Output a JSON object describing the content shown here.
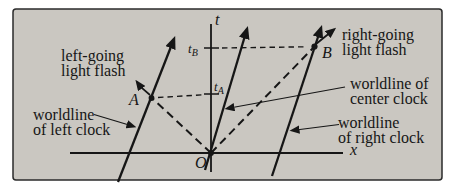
{
  "colors": {
    "page_bg": "#ffffff",
    "panel_bg": "#cac7c1",
    "panel_border": "#2b2b2b",
    "ink": "#161616"
  },
  "axes": {
    "t_label": "t",
    "x_label": "x",
    "origin_label": "O"
  },
  "ticks": {
    "t_A": {
      "base": "t",
      "sub": "A"
    },
    "t_B": {
      "base": "t",
      "sub": "B"
    }
  },
  "events": {
    "A": "A",
    "B": "B"
  },
  "annotations": {
    "left_flash": {
      "line1": "left-going",
      "line2": "light flash"
    },
    "right_flash": {
      "line1": "right-going",
      "line2": "light flash"
    },
    "left_clock": {
      "line1": "worldline",
      "line2": "of left clock"
    },
    "center_clock": {
      "line1": "worldline of",
      "line2": "center clock"
    },
    "right_clock": {
      "line1": "worldline",
      "line2": "of right clock"
    }
  }
}
